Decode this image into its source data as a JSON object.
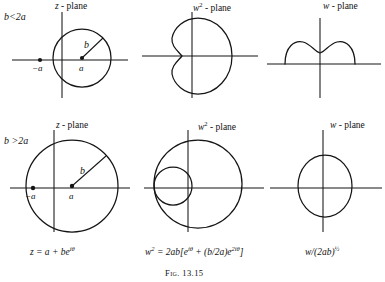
{
  "figure": {
    "caption": "Fig. 13.15",
    "rows": [
      {
        "condition": "b<2a",
        "panels": [
          {
            "plane_label_symbol": "z",
            "plane_label_suffix": " - plane",
            "point_left_label": "−a",
            "point_center_label": "a",
            "radius_label": "b",
            "curve_type": "circle-not-enclosing-origin"
          },
          {
            "plane_label_symbol": "w",
            "plane_label_exponent": "2",
            "plane_label_suffix": " - plane",
            "curve_type": "dimpled-limacon"
          },
          {
            "plane_label_symbol": "w",
            "plane_label_suffix": " - plane",
            "curve_type": "double-hump-arc"
          }
        ]
      },
      {
        "condition": "b >2a",
        "panels": [
          {
            "plane_label_symbol": "z",
            "plane_label_suffix": " - plane",
            "point_left_label": "−a",
            "point_center_label": "a",
            "radius_label": "b",
            "curve_type": "circle-enclosing-origin"
          },
          {
            "plane_label_symbol": "w",
            "plane_label_exponent": "2",
            "plane_label_suffix": " - plane",
            "curve_type": "looped-limacon"
          },
          {
            "plane_label_symbol": "w",
            "plane_label_suffix": " - plane",
            "curve_type": "closed-oval"
          }
        ]
      }
    ],
    "equations": [
      {
        "text_html": "z = a + be",
        "exponent": "iθ"
      },
      {
        "text_html": "w",
        "exponent": "2",
        "rest": " = 2ab[e",
        "exp2": "iθ",
        "rest2": " + (b/2a)e",
        "exp3": "2iθ",
        "rest3": "]"
      },
      {
        "text_html": "w/(2ab)",
        "exponent": "½"
      }
    ]
  }
}
